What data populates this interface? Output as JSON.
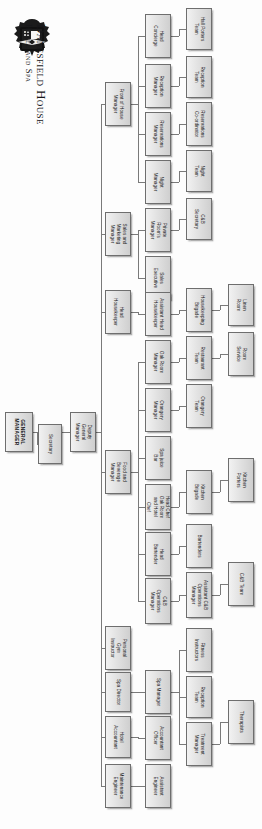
{
  "brand": {
    "logo_icon": "danesfield-crest-icon",
    "name": "Danesfield House",
    "subtitle": "Hotel and Spa"
  },
  "chart_data": {
    "type": "diagram",
    "orientation": "rotated-90",
    "nodes": [
      {
        "id": "gm",
        "label": "GENERAL\nMANAGER",
        "col": 0,
        "x": 5,
        "y": 412,
        "w": 28,
        "h": 40
      },
      {
        "id": "sec",
        "label": "Secretary",
        "col": 1,
        "x": 38,
        "y": 424,
        "w": 24,
        "h": 40
      },
      {
        "id": "dgm",
        "label": "Deputy\nGeneral\nManager",
        "col": 1,
        "x": 70,
        "y": 412,
        "w": 26,
        "h": 40
      },
      {
        "id": "foh",
        "label": "Front of House\nManager",
        "col": 2,
        "x": 105,
        "y": 82,
        "w": 26,
        "h": 44
      },
      {
        "id": "smm",
        "label": "Sales and\nMarketing\nManager",
        "col": 2,
        "x": 105,
        "y": 212,
        "w": 26,
        "h": 44
      },
      {
        "id": "hhk",
        "label": "Head\nHousekeeper",
        "col": 2,
        "x": 105,
        "y": 290,
        "w": 26,
        "h": 44
      },
      {
        "id": "fbm",
        "label": "Food and\nBeverage\nManager",
        "col": 2,
        "x": 105,
        "y": 450,
        "w": 26,
        "h": 44
      },
      {
        "id": "pgi",
        "label": "Personal\nGym\nInstructor",
        "col": 2,
        "x": 105,
        "y": 626,
        "w": 26,
        "h": 44
      },
      {
        "id": "spadir",
        "label": "Spa Director",
        "col": 2,
        "x": 105,
        "y": 672,
        "w": 26,
        "h": 40
      },
      {
        "id": "hotacc",
        "label": "Hotel\nAccountant",
        "col": 2,
        "x": 105,
        "y": 716,
        "w": 26,
        "h": 42
      },
      {
        "id": "maint",
        "label": "Maintenance\nEngineer",
        "col": 2,
        "x": 105,
        "y": 764,
        "w": 26,
        "h": 44
      },
      {
        "id": "headcon",
        "label": "Head\nConcierge",
        "col": 3,
        "x": 145,
        "y": 14,
        "w": 26,
        "h": 44
      },
      {
        "id": "recman",
        "label": "Reception\nManager",
        "col": 3,
        "x": 145,
        "y": 64,
        "w": 26,
        "h": 44
      },
      {
        "id": "resman",
        "label": "Reservations\nManager",
        "col": 3,
        "x": 145,
        "y": 112,
        "w": 26,
        "h": 44
      },
      {
        "id": "nightman",
        "label": "Night\nManager",
        "col": 3,
        "x": 145,
        "y": 160,
        "w": 26,
        "h": 44
      },
      {
        "id": "privrm",
        "label": "Private\nRoom's\nManager",
        "col": 3,
        "x": 145,
        "y": 208,
        "w": 26,
        "h": 44
      },
      {
        "id": "salesex",
        "label": "Sales\nExecutive",
        "col": 3,
        "x": 145,
        "y": 256,
        "w": 26,
        "h": 44
      },
      {
        "id": "asshhk",
        "label": "Assistant Head\nHousekeeper",
        "col": 3,
        "x": 145,
        "y": 292,
        "w": 26,
        "h": 44
      },
      {
        "id": "oakman",
        "label": "Oak Room\nManager",
        "col": 3,
        "x": 145,
        "y": 340,
        "w": 26,
        "h": 44
      },
      {
        "id": "orangman",
        "label": "Orangery\nManager",
        "col": 3,
        "x": 145,
        "y": 388,
        "w": 26,
        "h": 44
      },
      {
        "id": "spajuice",
        "label": "Spa juice\nBar",
        "col": 3,
        "x": 145,
        "y": 436,
        "w": 26,
        "h": 44
      },
      {
        "id": "headchef",
        "label": "Head Chef\nOak Room\nand Hotel\nChef",
        "col": 3,
        "x": 145,
        "y": 484,
        "w": 26,
        "h": 46
      },
      {
        "id": "headbar",
        "label": "Head\nBartender",
        "col": 3,
        "x": 145,
        "y": 532,
        "w": 26,
        "h": 44
      },
      {
        "id": "cbops",
        "label": "C&B\nOperations\nManager",
        "col": 3,
        "x": 145,
        "y": 578,
        "w": 26,
        "h": 46
      },
      {
        "id": "spaman",
        "label": "Spa Manager",
        "col": 3,
        "x": 145,
        "y": 670,
        "w": 26,
        "h": 44
      },
      {
        "id": "accoff",
        "label": "Accountant\nOfficer",
        "col": 3,
        "x": 145,
        "y": 716,
        "w": 26,
        "h": 44
      },
      {
        "id": "asseng",
        "label": "Assistant\nEngineer",
        "col": 3,
        "x": 145,
        "y": 764,
        "w": 26,
        "h": 44
      },
      {
        "id": "hallport",
        "label": "Hall Porters\nTeam",
        "col": 4,
        "x": 186,
        "y": 8,
        "w": 26,
        "h": 42
      },
      {
        "id": "recteam",
        "label": "Reception\nTeam",
        "col": 4,
        "x": 186,
        "y": 56,
        "w": 26,
        "h": 42
      },
      {
        "id": "rescoord",
        "label": "Reservations\nCo-ordinator",
        "col": 4,
        "x": 186,
        "y": 102,
        "w": 26,
        "h": 44
      },
      {
        "id": "nightteam",
        "label": "Night\nTeam",
        "col": 4,
        "x": 186,
        "y": 150,
        "w": 26,
        "h": 42
      },
      {
        "id": "cbsec",
        "label": "C&B\nSecretary",
        "col": 4,
        "x": 186,
        "y": 198,
        "w": 26,
        "h": 42
      },
      {
        "id": "hkbrig",
        "label": "Housekeeping\nBrigade",
        "col": 4,
        "x": 186,
        "y": 288,
        "w": 26,
        "h": 44
      },
      {
        "id": "restteam",
        "label": "Restaurant\nTeam",
        "col": 4,
        "x": 186,
        "y": 336,
        "w": 26,
        "h": 44
      },
      {
        "id": "orangteam",
        "label": "Orangery\nTeam",
        "col": 4,
        "x": 186,
        "y": 384,
        "w": 26,
        "h": 44
      },
      {
        "id": "kitbrig",
        "label": "Kitchen\nBrigade",
        "col": 4,
        "x": 186,
        "y": 470,
        "w": 26,
        "h": 44
      },
      {
        "id": "bartend",
        "label": "Bartenders",
        "col": 4,
        "x": 186,
        "y": 524,
        "w": 26,
        "h": 44
      },
      {
        "id": "asscbops",
        "label": "Assistant C&B\nOperations\nManager",
        "col": 4,
        "x": 186,
        "y": 572,
        "w": 26,
        "h": 46
      },
      {
        "id": "fitinstr",
        "label": "Fitness\nInstructors",
        "col": 4,
        "x": 186,
        "y": 628,
        "w": 26,
        "h": 44
      },
      {
        "id": "sparec",
        "label": "Reception\nTeam",
        "col": 4,
        "x": 186,
        "y": 676,
        "w": 26,
        "h": 42
      },
      {
        "id": "treatman",
        "label": "Treatment\nManager",
        "col": 4,
        "x": 186,
        "y": 722,
        "w": 26,
        "h": 44
      },
      {
        "id": "hallport5",
        "label": "Hall Porters\nTeam",
        "col": 5,
        "x": 226,
        "y": 8,
        "w": 26,
        "h": 42,
        "hidden": true
      },
      {
        "id": "linenrm",
        "label": "Linen\nRoom",
        "col": 5,
        "x": 228,
        "y": 284,
        "w": 26,
        "h": 42
      },
      {
        "id": "roomserv",
        "label": "Room\nService",
        "col": 5,
        "x": 228,
        "y": 332,
        "w": 26,
        "h": 44
      },
      {
        "id": "kitport",
        "label": "Kitchen\nPorters",
        "col": 5,
        "x": 228,
        "y": 458,
        "w": 26,
        "h": 44
      },
      {
        "id": "cbteam",
        "label": "C&B Team",
        "col": 5,
        "x": 228,
        "y": 562,
        "w": 26,
        "h": 44
      },
      {
        "id": "therap",
        "label": "Therapists",
        "col": 5,
        "x": 228,
        "y": 700,
        "w": 26,
        "h": 44
      }
    ],
    "edges": [
      "gm -> sec",
      "gm -> dgm",
      "dgm -> foh",
      "dgm -> smm",
      "dgm -> hhk",
      "dgm -> fbm",
      "dgm -> pgi",
      "dgm -> spadir",
      "dgm -> hotacc",
      "dgm -> maint",
      "foh -> headcon",
      "foh -> recman",
      "foh -> resman",
      "foh -> nightman",
      "smm -> privrm",
      "smm -> salesex",
      "hhk -> asshhk",
      "fbm -> oakman",
      "fbm -> orangman",
      "fbm -> spajuice",
      "fbm -> headchef",
      "fbm -> headbar",
      "fbm -> cbops",
      "spadir -> spaman",
      "hotacc -> accoff",
      "maint -> asseng",
      "headcon -> hallport",
      "recman -> recteam",
      "resman -> rescoord",
      "nightman -> nightteam",
      "privrm -> cbsec",
      "asshhk -> hkbrig",
      "oakman -> restteam",
      "orangman -> orangteam",
      "headchef -> kitbrig",
      "headbar -> bartend",
      "cbops -> asscbops",
      "spaman -> fitinstr",
      "spaman -> sparec",
      "spaman -> treatman",
      "hkbrig -> linenrm",
      "restteam -> roomserv",
      "kitbrig -> kitport",
      "asscbops -> cbteam",
      "treatman -> therap"
    ]
  },
  "style": {
    "node_border": "#6e6e6e",
    "node_fill_light": "#f2f2f2",
    "node_fill_dark": "#cfcfcf",
    "line_color": "#7a7a7a",
    "text_color": "#18181b",
    "page_background": "#fdfdfd"
  }
}
